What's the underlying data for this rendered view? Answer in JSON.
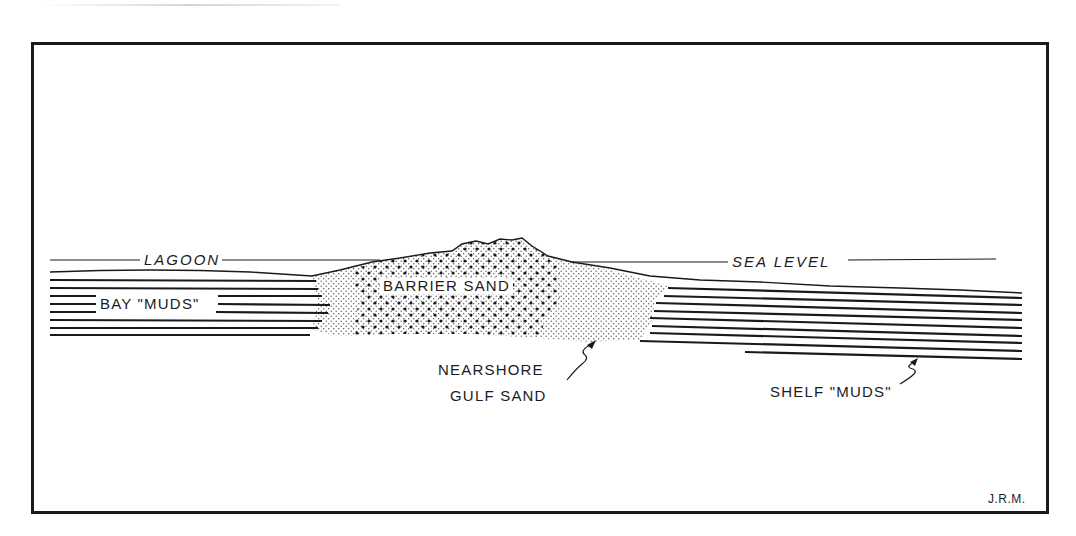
{
  "diagram": {
    "type": "geologic-cross-section",
    "labels": {
      "lagoon": "LAGOON",
      "sea_level": "SEA LEVEL",
      "bay_muds": "BAY \"MUDS\"",
      "barrier_sand": "BARRIER SAND",
      "nearshore_line1": "NEARSHORE",
      "nearshore_line2": "GULF SAND",
      "shelf_muds": "SHELF \"MUDS\""
    },
    "signature": "J.R.M.",
    "units": [
      {
        "name": "Bay muds",
        "pattern": "horizontal-lines",
        "position": "left"
      },
      {
        "name": "Barrier sand",
        "pattern": "coarse-dots",
        "position": "center"
      },
      {
        "name": "Nearshore gulf sand",
        "pattern": "fine-dots",
        "position": "center-right"
      },
      {
        "name": "Shelf muds",
        "pattern": "horizontal-lines",
        "position": "right"
      }
    ],
    "colors": {
      "ink": "#1a1a1a",
      "paper": "#ffffff"
    }
  }
}
